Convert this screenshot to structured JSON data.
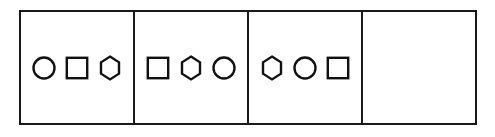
{
  "figure": {
    "kind": "sequence-puzzle",
    "panel_count": 4,
    "border_color": "#1a1a1a",
    "shape_stroke_color": "#111111",
    "background_color": "#ffffff",
    "panels": [
      {
        "index": 1,
        "name": "panel-1",
        "empty": false,
        "shapes": [
          {
            "name": "circle-shape",
            "type": "circle"
          },
          {
            "name": "square-shape",
            "type": "square"
          },
          {
            "name": "hexagon-shape",
            "type": "hexagon"
          }
        ]
      },
      {
        "index": 2,
        "name": "panel-2",
        "empty": false,
        "shapes": [
          {
            "name": "square-shape",
            "type": "square"
          },
          {
            "name": "hexagon-shape",
            "type": "hexagon"
          },
          {
            "name": "circle-shape",
            "type": "circle"
          }
        ]
      },
      {
        "index": 3,
        "name": "panel-3",
        "empty": false,
        "shapes": [
          {
            "name": "hexagon-shape",
            "type": "hexagon"
          },
          {
            "name": "circle-shape",
            "type": "circle"
          },
          {
            "name": "square-shape",
            "type": "square"
          }
        ]
      },
      {
        "index": 4,
        "name": "panel-4-answer-slot",
        "empty": true,
        "shapes": []
      }
    ]
  }
}
